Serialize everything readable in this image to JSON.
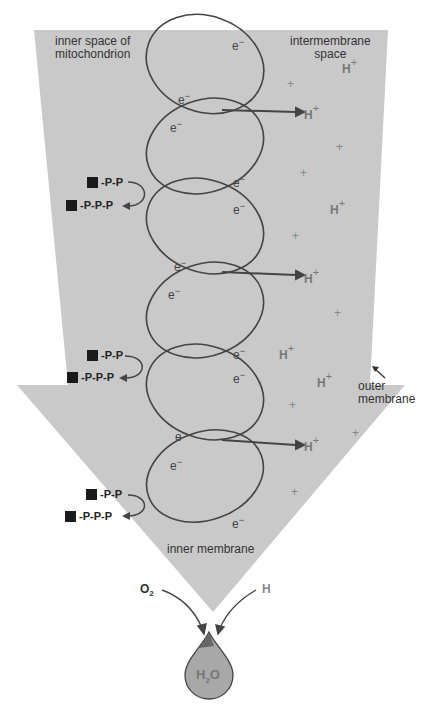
{
  "diagram": {
    "title_partial": "",
    "regions": {
      "inner_space": "inner space of mitochondrion",
      "inner_space_line1": "inner space of",
      "inner_space_line2": "mitochondrion",
      "intermembrane_line1": "intermembrane",
      "intermembrane_line2": "space",
      "outer_membrane_line1": "outer",
      "outer_membrane_line2": "membrane",
      "inner_membrane": "inner membrane"
    },
    "electron_label": "e",
    "electron_charge": "−",
    "proton_label": "H",
    "proton_charge": "+",
    "atp_synthesis": [
      {
        "adp": "-P-P",
        "atp": "-P-P-P"
      },
      {
        "adp": "-P-P",
        "atp": "-P-P-P"
      },
      {
        "adp": "-P-P",
        "atp": "-P-P-P"
      }
    ],
    "final": {
      "oxygen": "O",
      "oxygen_sub": "2",
      "hydrogen": "H",
      "water_h": "H",
      "water_sub": "2",
      "water_o": "O"
    },
    "colors": {
      "arrow_fill": "#c8c8c8",
      "drop_fill": "#a8a8a8",
      "line": "#444444",
      "text_gray": "#777777"
    }
  }
}
